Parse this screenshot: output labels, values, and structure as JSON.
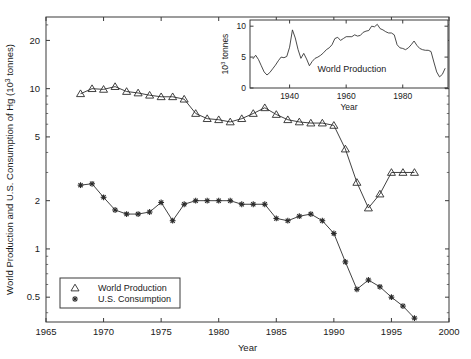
{
  "figure": {
    "background": "#ffffff",
    "axis_color": "#3a3a3a",
    "line_color": "#2b2b2b"
  },
  "chart_data": {
    "type": "line",
    "title": "",
    "xlabel": "Year",
    "ylabel": "World Production and U.S. Consumption of Hg (10³ tonnes)",
    "yscale": "log",
    "xlim": [
      1965,
      2000
    ],
    "ylim": [
      0.35,
      28
    ],
    "xticks": [
      1965,
      1970,
      1975,
      1980,
      1985,
      1990,
      1995,
      2000
    ],
    "xticklabels": [
      "1965",
      "1970",
      "1975",
      "1980",
      "1985",
      "1990",
      "1995",
      "2000"
    ],
    "yticks": [
      0.5,
      1,
      2,
      5,
      10,
      20
    ],
    "yticklabels": [
      "0.5",
      "1",
      "2",
      "5",
      "10",
      "20"
    ],
    "grid": false,
    "legend_position": "lower left",
    "series": [
      {
        "name": "World Production",
        "marker": "triangle",
        "x": [
          1968,
          1969,
          1970,
          1971,
          1972,
          1973,
          1974,
          1975,
          1976,
          1977,
          1978,
          1979,
          1980,
          1981,
          1982,
          1983,
          1984,
          1985,
          1986,
          1987,
          1988,
          1989,
          1990,
          1991,
          1992,
          1993,
          1994,
          1995,
          1996,
          1997
        ],
        "values": [
          9.3,
          10.0,
          9.9,
          10.3,
          9.6,
          9.4,
          9.1,
          8.9,
          8.9,
          8.6,
          7.0,
          6.5,
          6.4,
          6.2,
          6.5,
          7.0,
          7.6,
          6.9,
          6.4,
          6.2,
          6.1,
          6.1,
          5.9,
          4.2,
          2.6,
          1.8,
          2.2,
          3.0,
          3.0,
          3.0
        ]
      },
      {
        "name": "U.S. Consumption",
        "marker": "asterisk",
        "x": [
          1968,
          1969,
          1970,
          1971,
          1972,
          1973,
          1974,
          1975,
          1976,
          1977,
          1978,
          1979,
          1980,
          1981,
          1982,
          1983,
          1984,
          1985,
          1986,
          1987,
          1988,
          1989,
          1990,
          1991,
          1992,
          1993,
          1994,
          1995,
          1996,
          1997
        ],
        "values": [
          2.5,
          2.55,
          2.1,
          1.75,
          1.65,
          1.65,
          1.7,
          1.95,
          1.5,
          1.9,
          2.0,
          2.0,
          2.0,
          2.0,
          1.9,
          1.9,
          1.9,
          1.55,
          1.5,
          1.6,
          1.65,
          1.5,
          1.25,
          0.83,
          0.56,
          0.64,
          0.58,
          0.5,
          0.44,
          0.37
        ]
      }
    ],
    "legend": [
      {
        "label": "World Production",
        "marker": "triangle"
      },
      {
        "label": "U.S. Consumption",
        "marker": "asterisk"
      }
    ],
    "inset": {
      "type": "line",
      "name": "World Production",
      "annotation": "World Production",
      "xlabel": "Year",
      "ylabel": "10³ tonnes",
      "xlim": [
        1926,
        1996
      ],
      "ylim": [
        0,
        11
      ],
      "xticks": [
        1940,
        1960,
        1980
      ],
      "xticklabels": [
        "1940",
        "1960",
        "1980"
      ],
      "yticks": [
        0,
        5,
        10
      ],
      "yticklabels": [
        "0",
        "5",
        "10"
      ],
      "x": [
        1927,
        1928,
        1929,
        1930,
        1931,
        1932,
        1933,
        1934,
        1935,
        1936,
        1937,
        1938,
        1939,
        1940,
        1941,
        1942,
        1943,
        1944,
        1945,
        1946,
        1947,
        1948,
        1949,
        1950,
        1951,
        1952,
        1953,
        1954,
        1955,
        1956,
        1957,
        1958,
        1959,
        1960,
        1961,
        1962,
        1963,
        1964,
        1965,
        1966,
        1967,
        1968,
        1969,
        1970,
        1971,
        1972,
        1973,
        1974,
        1975,
        1976,
        1977,
        1978,
        1979,
        1980,
        1981,
        1982,
        1983,
        1984,
        1985,
        1986,
        1987,
        1988,
        1989,
        1990,
        1991,
        1992,
        1993,
        1994,
        1995
      ],
      "values": [
        4.7,
        5.3,
        4.6,
        3.6,
        2.6,
        2.1,
        2.5,
        3.1,
        3.7,
        4.4,
        5.0,
        4.9,
        5.1,
        6.6,
        9.4,
        8.1,
        6.2,
        4.8,
        5.6,
        4.7,
        3.6,
        4.3,
        4.8,
        5.0,
        5.3,
        5.7,
        6.2,
        6.5,
        7.0,
        8.0,
        8.2,
        7.7,
        8.0,
        8.3,
        8.3,
        8.3,
        8.6,
        8.4,
        8.5,
        9.0,
        9.2,
        9.3,
        10.0,
        9.9,
        10.3,
        9.6,
        9.4,
        9.1,
        8.9,
        8.9,
        8.6,
        7.0,
        6.5,
        6.4,
        6.2,
        6.5,
        7.0,
        7.6,
        6.9,
        6.4,
        6.2,
        6.1,
        6.1,
        5.9,
        4.2,
        2.6,
        1.8,
        2.2,
        3.2
      ]
    }
  }
}
